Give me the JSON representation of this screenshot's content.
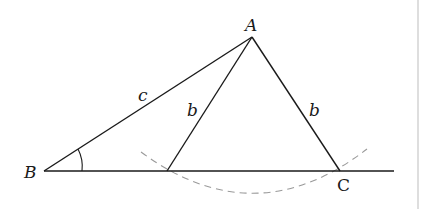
{
  "diagram": {
    "colors": {
      "stroke": "#1a1a1a",
      "dashed_arc": "#9a9a9a",
      "border": "#c8c8c8"
    },
    "points": {
      "A": {
        "label": "A",
        "x": 252,
        "y": 37
      },
      "B": {
        "label": "B",
        "x": 44,
        "y": 171
      },
      "C": {
        "label": "C",
        "x": 340,
        "y": 171
      },
      "D": {
        "label": "",
        "x": 167,
        "y": 171
      }
    },
    "side_labels": {
      "c": "c",
      "b_left": "b",
      "b_right": "b"
    },
    "baseline_end_x": 394,
    "angle_marker_at": "B"
  }
}
